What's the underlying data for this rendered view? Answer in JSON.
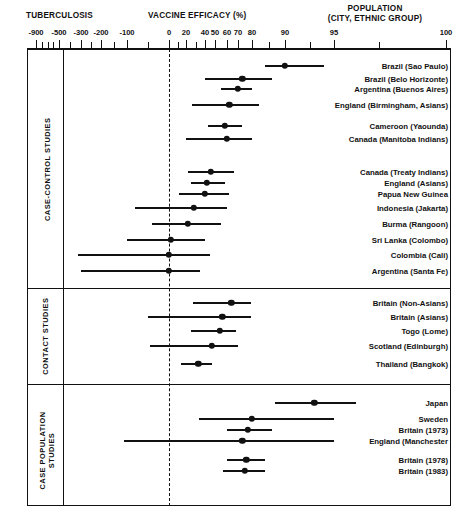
{
  "header": {
    "left_title": "TUBERCULOSIS",
    "center_title": "VACCINE EFFICACY (%)",
    "right_title_line1": "POPULATION",
    "right_title_line2": "(CITY, ETHNIC GROUP)"
  },
  "axis": {
    "label": "VACCINE EFFICACY (%)",
    "tick_labels": [
      "-900",
      "-500",
      "-300",
      "-200",
      "-100",
      "0",
      "20",
      "40",
      "50",
      "60",
      "70",
      "80",
      "90",
      "95",
      "100"
    ],
    "zero_reference": 0,
    "scale": "logit / log-odds",
    "range": [
      -900,
      100
    ]
  },
  "sections": [
    {
      "id": "case-control",
      "label": "CASE-CONTROL STUDIES"
    },
    {
      "id": "contact",
      "label": "CONTACT STUDIES"
    },
    {
      "id": "case-population",
      "label": "CASE POPULATION\nSTUDIES"
    }
  ],
  "chart_data": {
    "type": "forest",
    "title": "VACCINE EFFICACY (%)",
    "xlabel": "VACCINE EFFICACY (%)",
    "ylabel": "POPULATION (CITY, ETHNIC GROUP)",
    "xlim": [
      -900,
      100
    ],
    "x_ticks": [
      -900,
      -500,
      -300,
      -200,
      -100,
      0,
      20,
      40,
      50,
      60,
      70,
      80,
      90,
      95,
      100
    ],
    "grid": false,
    "legend": "none",
    "reference_line": 0,
    "groups": [
      {
        "name": "CASE-CONTROL STUDIES",
        "studies": [
          {
            "label": "Brazil (Sao Paulo)",
            "estimate": 90,
            "low": 84,
            "high": 94
          },
          {
            "label": "Brazil (Belo Horizonte)",
            "estimate": 73,
            "low": 40,
            "high": 86
          },
          {
            "label": "Argentina (Buenos Aires)",
            "estimate": 70,
            "low": 55,
            "high": 80
          },
          {
            "label": "England (Birmingham, Asians)",
            "estimate": 62,
            "low": 26,
            "high": 82
          },
          {
            "label": "Cameroon (Yaounda)",
            "estimate": 58,
            "low": 43,
            "high": 73
          },
          {
            "label": "Canada (Manitoba Indians)",
            "estimate": 60,
            "low": 20,
            "high": 80
          },
          {
            "label": "Canada (Treaty Indians)",
            "estimate": 46,
            "low": 22,
            "high": 66
          },
          {
            "label": "England (Asians)",
            "estimate": 42,
            "low": 25,
            "high": 58
          },
          {
            "label": "Papua New Guinea",
            "estimate": 40,
            "low": 12,
            "high": 62
          },
          {
            "label": "Indonesia (Jakarta)",
            "estimate": 28,
            "low": -80,
            "high": 60
          },
          {
            "label": "Burma (Rangoon)",
            "estimate": 22,
            "low": -40,
            "high": 55
          },
          {
            "label": "Sri Lanka (Colombo)",
            "estimate": 2,
            "low": -100,
            "high": 40
          },
          {
            "label": "Colombia (Cali)",
            "estimate": 0,
            "low": -330,
            "high": 45
          },
          {
            "label": "Argentina (Santa Fe)",
            "estimate": 0,
            "low": -300,
            "high": 35
          }
        ]
      },
      {
        "name": "CONTACT STUDIES",
        "studies": [
          {
            "label": "Britain (Non-Asians)",
            "estimate": 64,
            "low": 27,
            "high": 79
          },
          {
            "label": "Britain (Asians)",
            "estimate": 56,
            "low": -50,
            "high": 79
          },
          {
            "label": "Togo (Lome)",
            "estimate": 54,
            "low": 25,
            "high": 68
          },
          {
            "label": "Scotland (Edinburgh)",
            "estimate": 47,
            "low": -45,
            "high": 70
          },
          {
            "label": "Thailand (Bangkok)",
            "estimate": 33,
            "low": 14,
            "high": 47
          }
        ]
      },
      {
        "name": "CASE POPULATION STUDIES",
        "studies": [
          {
            "label": "Japan",
            "estimate": 93,
            "low": 87,
            "high": 96
          },
          {
            "label": "Sweden",
            "estimate": 80,
            "low": 34,
            "high": 95
          },
          {
            "label": "Britain (1973)",
            "estimate": 77,
            "low": 60,
            "high": 86
          },
          {
            "label": "England (Manchester",
            "estimate": 73,
            "low": -110,
            "high": 95
          },
          {
            "label": "Britain (1978)",
            "estimate": 76,
            "low": 60,
            "high": 84
          },
          {
            "label": "Britain (1983)",
            "estimate": 75,
            "low": 57,
            "high": 84
          }
        ]
      }
    ]
  }
}
